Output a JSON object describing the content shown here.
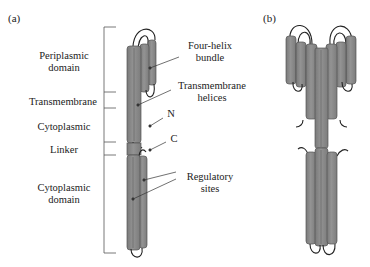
{
  "panel_a": {
    "label": "(a)",
    "domains": [
      {
        "line1": "Periplasmic",
        "line2": "domain"
      },
      {
        "line1": "Transmembrane"
      },
      {
        "line1": "Cytoplasmic"
      },
      {
        "line1": "Linker"
      },
      {
        "line1": "Cytoplasmic",
        "line2": "domain"
      }
    ],
    "annotations": {
      "four_helix_1": "Four-helix",
      "four_helix_2": "bundle",
      "tm_helices_1": "Transmembrane",
      "tm_helices_2": "helices",
      "n_terminus": "N",
      "c_terminus": "C",
      "regulatory_1": "Regulatory",
      "regulatory_2": "sites"
    }
  },
  "panel_b": {
    "label": "(b)"
  },
  "colors": {
    "helix_fill": "#8a8a8a",
    "helix_edge": "#555555",
    "line": "#333333"
  }
}
